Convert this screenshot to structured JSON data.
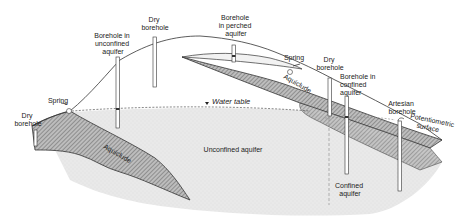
{
  "diagram": {
    "labels": {
      "dry_borehole_left": [
        "Dry",
        "borehole"
      ],
      "spring_left": "Spring",
      "borehole_unconfined": [
        "Borehole in",
        "unconfined",
        "aquifer"
      ],
      "dry_borehole_top": [
        "Dry",
        "borehole"
      ],
      "borehole_perched": [
        "Borehole",
        "in perched",
        "aquifer"
      ],
      "spring_right": "Spring",
      "dry_borehole_right": [
        "Dry",
        "borehole"
      ],
      "borehole_confined": [
        "Borehole in",
        "confined",
        "aquifer"
      ],
      "artesian_borehole": [
        "Artesian",
        "borehole"
      ],
      "potentiometric_surface": [
        "Potentiometric",
        "surface"
      ],
      "water_table": "Water table",
      "aquiclude_left": "Aquiclude",
      "aquiclude_right": "Aquiclude",
      "unconfined_aquifer": "Unconfined aquifer",
      "confined_aquifer": [
        "Confined",
        "aquifer"
      ]
    },
    "colors": {
      "aquifer_fill": "#e6e6e6",
      "aquiclude_fill": "#9a9a9a",
      "line": "#333333",
      "background": "#ffffff"
    }
  }
}
